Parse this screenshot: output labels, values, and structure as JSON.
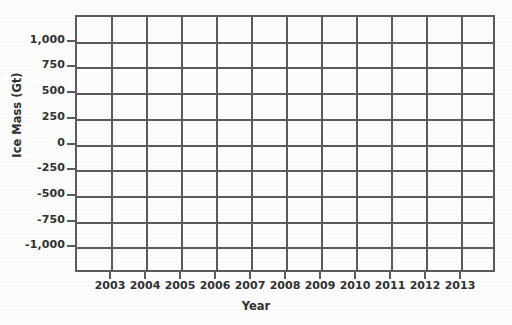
{
  "chart_data": {
    "type": "line",
    "title": "",
    "subtitle": "",
    "xlabel": "Year",
    "ylabel": "Ice Mass (Gt)",
    "grid": true,
    "legend": "none",
    "note": "Empty grid / blank plotting template — no data series are plotted in the figure.",
    "series": [],
    "x": [
      2003,
      2004,
      2005,
      2006,
      2007,
      2008,
      2009,
      2010,
      2011,
      2012,
      2013
    ],
    "xtick_labels": [
      "2003",
      "2004",
      "2005",
      "2006",
      "2007",
      "2008",
      "2009",
      "2010",
      "2011",
      "2012",
      "2013"
    ],
    "ytick_values": [
      1000,
      750,
      500,
      250,
      0,
      -250,
      -500,
      -750,
      -1000
    ],
    "ytick_labels": [
      "1,000",
      "750",
      "500",
      "250",
      "0",
      "-250",
      "-500",
      "-750",
      "-1,000"
    ],
    "ylim": [
      -1250,
      1250
    ],
    "xlim": [
      2002,
      2014
    ]
  },
  "axes": {
    "y_title": "Ice Mass (Gt)",
    "x_title": "Year",
    "y_labels": [
      "1,000",
      "750",
      "500",
      "250",
      "0",
      "-250",
      "-500",
      "-750",
      "-1,000"
    ],
    "x_labels": [
      "2003",
      "2004",
      "2005",
      "2006",
      "2007",
      "2008",
      "2009",
      "2010",
      "2011",
      "2012",
      "2013"
    ]
  },
  "style": {
    "grid_color": "#5a5a5a",
    "text_color": "#2f2f2f",
    "plot_background": "#ffffff",
    "page_background": "#fefefe"
  }
}
